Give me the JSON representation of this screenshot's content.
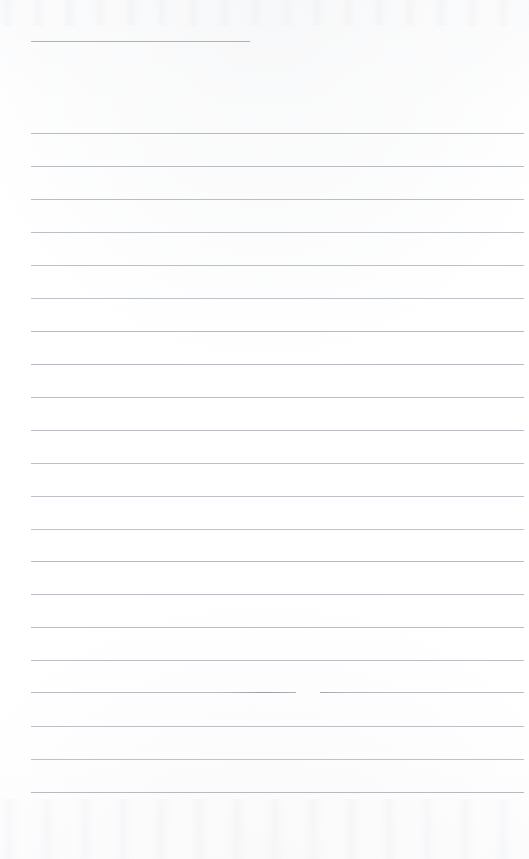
{
  "image": {
    "kind": "scanned-lined-paper",
    "description": "Blank scanned sheet of ruled notebook paper",
    "width": 529,
    "height": 859,
    "background_color": "#ffffff",
    "paper_tint": "#fdfdfd"
  },
  "ruling": {
    "line_color": "#b2b6bd",
    "accent_line_color": "#9ba0a8",
    "line_thickness_px": 1,
    "left_margin_x": 31,
    "right_margin_x": 524,
    "line_spacing_px": 32.7,
    "total_lines": 22,
    "has_vertical_margin_rule": false,
    "top_short_rule": {
      "y": 41,
      "x_start": 31,
      "x_end": 250,
      "note": "shorter, slightly darker rule near top of sheet"
    },
    "broken_rule": {
      "y": 692,
      "gap_x_start": 296,
      "gap_x_end": 320,
      "note": "rule interrupted by a small gap with darker tips on either side"
    },
    "lines": [
      {
        "y": 41,
        "x_start": 31,
        "x_end": 250,
        "accent": true
      },
      {
        "y": 133,
        "x_start": 31,
        "x_end": 524,
        "accent": false
      },
      {
        "y": 166,
        "x_start": 31,
        "x_end": 524,
        "accent": false
      },
      {
        "y": 199,
        "x_start": 31,
        "x_end": 524,
        "accent": false
      },
      {
        "y": 232,
        "x_start": 31,
        "x_end": 524,
        "accent": false
      },
      {
        "y": 265,
        "x_start": 31,
        "x_end": 524,
        "accent": false
      },
      {
        "y": 298,
        "x_start": 31,
        "x_end": 524,
        "accent": false
      },
      {
        "y": 331,
        "x_start": 31,
        "x_end": 524,
        "accent": false
      },
      {
        "y": 364,
        "x_start": 31,
        "x_end": 524,
        "accent": false
      },
      {
        "y": 397,
        "x_start": 31,
        "x_end": 524,
        "accent": false
      },
      {
        "y": 430,
        "x_start": 31,
        "x_end": 524,
        "accent": false
      },
      {
        "y": 463,
        "x_start": 31,
        "x_end": 524,
        "accent": false
      },
      {
        "y": 496,
        "x_start": 31,
        "x_end": 524,
        "accent": false
      },
      {
        "y": 529,
        "x_start": 31,
        "x_end": 524,
        "accent": false
      },
      {
        "y": 561,
        "x_start": 31,
        "x_end": 524,
        "accent": false
      },
      {
        "y": 594,
        "x_start": 31,
        "x_end": 524,
        "accent": false
      },
      {
        "y": 627,
        "x_start": 31,
        "x_end": 524,
        "accent": false
      },
      {
        "y": 660,
        "x_start": 31,
        "x_end": 524,
        "accent": false
      },
      {
        "y": 726,
        "x_start": 31,
        "x_end": 524,
        "accent": false
      },
      {
        "y": 759,
        "x_start": 31,
        "x_end": 524,
        "accent": false
      },
      {
        "y": 792,
        "x_start": 31,
        "x_end": 524,
        "accent": false
      }
    ]
  },
  "content": {
    "handwriting_present": false,
    "typed_text_present": false,
    "visible_text": ""
  }
}
